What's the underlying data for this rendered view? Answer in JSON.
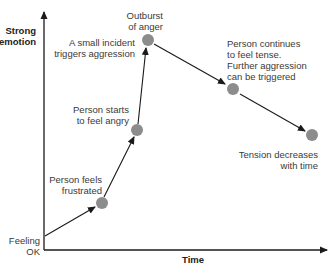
{
  "diagram": {
    "title": "",
    "y_axis_label": "Strong emotion",
    "x_axis_label": "Time",
    "origin_label": "Feeling OK",
    "colors": {
      "node": "#8c8c8c",
      "line": "#1a1a1a",
      "text": "#333333"
    },
    "nodes": [
      {
        "id": "start",
        "label": "Feeling OK",
        "x": 45,
        "y": 236
      },
      {
        "id": "frustrated",
        "label": "Person feels frustrated",
        "x": 102,
        "y": 203
      },
      {
        "id": "angry",
        "label": "Person starts to feel angry",
        "x": 137,
        "y": 130
      },
      {
        "id": "outburst",
        "label": "Outburst of anger",
        "sublabel": "A small incident triggers aggression",
        "x": 148,
        "y": 40
      },
      {
        "id": "tense",
        "label": "Person continues to feel tense. Further aggression can be triggered",
        "x": 233,
        "y": 89
      },
      {
        "id": "decrease",
        "label": "Tension decreases with time",
        "x": 312,
        "y": 135
      }
    ],
    "labels": {
      "y_axis_line1": "Strong",
      "y_axis_line2": "emotion",
      "origin_line1": "Feeling",
      "origin_line2": "OK",
      "frustrated_line1": "Person feels",
      "frustrated_line2": "frustrated",
      "angry_line1": "Person starts",
      "angry_line2": "to feel angry",
      "incident_line1": "A small incident",
      "incident_line2": "triggers aggression",
      "outburst_line1": "Outburst",
      "outburst_line2": "of anger",
      "tense_line1": "Person continues",
      "tense_line2": "to feel tense.",
      "tense_line3": "Further aggression",
      "tense_line4": "can be triggered",
      "decrease_line1": "Tension decreases",
      "decrease_line2": "with time",
      "x_axis": "Time"
    }
  }
}
